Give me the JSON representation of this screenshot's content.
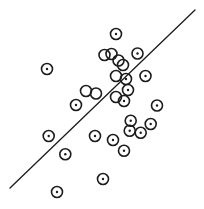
{
  "canvas": {
    "width": 204,
    "height": 209,
    "background": "#ffffff",
    "stroke_color": "#1c1c1c"
  },
  "chart_data": {
    "type": "scatter",
    "title": "",
    "xlabel": "",
    "ylabel": "",
    "axes_visible": false,
    "grid": false,
    "legend": false,
    "marker_style": {
      "shape": "open-circle-with-center-dot",
      "radius_px": 5.5,
      "stroke_width": 1.6,
      "dot_radius_px": 1.2,
      "color": "#1c1c1c"
    },
    "trend_line": {
      "x1": 10,
      "y1": 188,
      "x2": 195,
      "y2": 10,
      "stroke_width": 1.3,
      "color": "#1c1c1c"
    },
    "points": [
      {
        "x": 116,
        "y": 34,
        "dot": true
      },
      {
        "x": 47,
        "y": 69,
        "dot": true
      },
      {
        "x": 137.5,
        "y": 53.5,
        "dot": true
      },
      {
        "x": 104.5,
        "y": 55,
        "dot": false
      },
      {
        "x": 111.5,
        "y": 54,
        "dot": false
      },
      {
        "x": 118.5,
        "y": 60.5,
        "dot": false
      },
      {
        "x": 123,
        "y": 65,
        "dot": false
      },
      {
        "x": 116,
        "y": 76,
        "dot": false
      },
      {
        "x": 126,
        "y": 79,
        "dot": true
      },
      {
        "x": 145.5,
        "y": 76,
        "dot": true
      },
      {
        "x": 128,
        "y": 90,
        "dot": true
      },
      {
        "x": 86,
        "y": 91,
        "dot": false
      },
      {
        "x": 96,
        "y": 93.5,
        "dot": false
      },
      {
        "x": 116,
        "y": 97,
        "dot": false
      },
      {
        "x": 124,
        "y": 101,
        "dot": true
      },
      {
        "x": 157,
        "y": 105.5,
        "dot": true
      },
      {
        "x": 76,
        "y": 105,
        "dot": true
      },
      {
        "x": 48.7,
        "y": 136,
        "dot": true
      },
      {
        "x": 95,
        "y": 136,
        "dot": true
      },
      {
        "x": 113,
        "y": 140,
        "dot": true
      },
      {
        "x": 65.3,
        "y": 154.3,
        "dot": true
      },
      {
        "x": 130.7,
        "y": 120.7,
        "dot": true
      },
      {
        "x": 150.7,
        "y": 124,
        "dot": true
      },
      {
        "x": 129.7,
        "y": 130.7,
        "dot": true
      },
      {
        "x": 140.7,
        "y": 132.7,
        "dot": true
      },
      {
        "x": 124,
        "y": 150.7,
        "dot": true
      },
      {
        "x": 103,
        "y": 179,
        "dot": true
      },
      {
        "x": 57,
        "y": 192,
        "dot": true
      }
    ]
  }
}
